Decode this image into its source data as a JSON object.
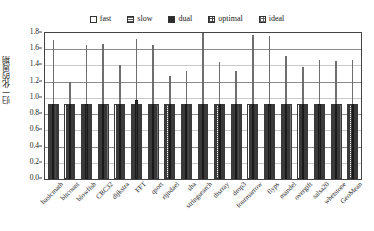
{
  "chart_data": {
    "type": "bar",
    "title": "",
    "xlabel": "",
    "ylabel": "归一化的周期",
    "ylim": [
      0.0,
      1.8
    ],
    "ytick_labels": [
      "0.0",
      "0.2",
      "0.4",
      "0.6",
      "0.8",
      "1.0",
      "1.2",
      "1.4",
      "1.6",
      "1.8"
    ],
    "ytick_values": [
      0.0,
      0.2,
      0.4,
      0.6,
      0.8,
      1.0,
      1.2,
      1.4,
      1.6,
      1.8
    ],
    "grid": true,
    "legend_position": "top-center",
    "categories": [
      "basicmath",
      "bitcount",
      "blowfish",
      "CRC32",
      "dijkstra",
      "FFT",
      "qsort",
      "rijndael",
      "sha",
      "stringsearch",
      "disrray",
      "drop3",
      "fourmarrow",
      "flyps",
      "mandel",
      "overgift",
      "salsa20",
      "whetstone",
      "GeoMean"
    ],
    "series": [
      {
        "name": "fast",
        "values": [
          0.93,
          0.93,
          0.93,
          0.93,
          0.93,
          0.93,
          0.93,
          0.93,
          0.93,
          0.93,
          0.93,
          0.93,
          0.93,
          0.93,
          0.93,
          0.93,
          0.93,
          0.93,
          0.93
        ]
      },
      {
        "name": "slow",
        "values": [
          0.92,
          0.92,
          0.92,
          0.92,
          0.92,
          0.92,
          0.92,
          0.92,
          0.92,
          0.92,
          0.92,
          0.92,
          0.92,
          0.92,
          0.92,
          0.92,
          0.92,
          0.92,
          0.92
        ]
      },
      {
        "name": "dual",
        "values": [
          0.93,
          0.93,
          0.93,
          0.93,
          0.93,
          0.97,
          0.93,
          0.93,
          0.93,
          0.93,
          0.93,
          0.93,
          0.93,
          0.93,
          0.93,
          0.93,
          0.93,
          0.93,
          0.93
        ]
      },
      {
        "name": "optimal",
        "values": [
          0.92,
          0.92,
          0.92,
          0.92,
          0.92,
          0.92,
          0.92,
          0.92,
          0.92,
          0.92,
          0.92,
          0.92,
          0.92,
          0.92,
          0.92,
          0.92,
          0.92,
          0.92,
          0.92
        ]
      },
      {
        "name": "ideal",
        "values": [
          0.92,
          0.92,
          0.92,
          0.92,
          0.92,
          0.92,
          0.92,
          0.92,
          0.92,
          0.92,
          0.92,
          0.92,
          0.92,
          0.92,
          0.92,
          0.92,
          0.92,
          0.92,
          0.92
        ]
      }
    ],
    "ideal_markers": {
      "name": "ideal-upper-marker",
      "values": [
        1.72,
        1.19,
        1.65,
        1.66,
        1.4,
        1.73,
        1.65,
        1.27,
        1.33,
        1.8,
        1.44,
        1.33,
        1.78,
        1.76,
        1.52,
        1.38,
        1.47,
        1.45,
        1.47
      ]
    }
  },
  "legend": {
    "items": [
      {
        "label": "fast",
        "swatch": "swatch-open-square"
      },
      {
        "label": "slow",
        "swatch": "swatch-hlines-square"
      },
      {
        "label": "dual",
        "swatch": "swatch-filled-square"
      },
      {
        "label": "optimal",
        "swatch": "swatch-crosshatch-square"
      },
      {
        "label": "ideal",
        "swatch": "swatch-crosshatch-light-square"
      }
    ]
  }
}
